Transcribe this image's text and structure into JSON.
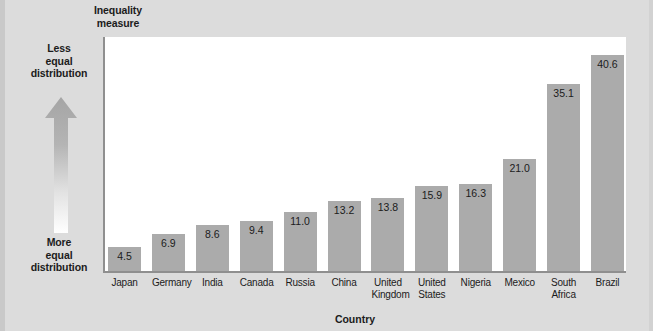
{
  "chart_data": {
    "type": "bar",
    "title": "",
    "ylabel": "Inequality measure",
    "xlabel": "Country",
    "ylim": [
      0,
      44
    ],
    "grid": false,
    "legend": "none",
    "categories": [
      "Japan",
      "Germany",
      "India",
      "Canada",
      "Russia",
      "China",
      "United Kingdom",
      "United States",
      "Nigeria",
      "Mexico",
      "South Africa",
      "Brazil"
    ],
    "values": [
      4.5,
      6.9,
      8.6,
      9.4,
      11.0,
      13.2,
      13.8,
      15.9,
      16.3,
      21.0,
      35.1,
      40.6
    ],
    "value_labels": [
      "4.5",
      "6.9",
      "8.6",
      "9.4",
      "11.0",
      "13.2",
      "13.8",
      "15.9",
      "16.3",
      "21.0",
      "35.1",
      "40.6"
    ],
    "annotations": [
      {
        "name": "axis-direction-top",
        "text": "Less equal distribution"
      },
      {
        "name": "axis-direction-bottom",
        "text": "More equal distribution"
      }
    ]
  },
  "axis": {
    "y_title_line1": "Inequality",
    "y_title_line2": "measure",
    "x_title": "Country"
  },
  "annotations": {
    "less_equal_line1": "Less",
    "less_equal_line2": "equal",
    "less_equal_line3": "distribution",
    "more_equal_line1": "More",
    "more_equal_line2": "equal",
    "more_equal_line3": "distribution"
  },
  "categories": [
    {
      "line1": "Japan",
      "line2": ""
    },
    {
      "line1": "Germany",
      "line2": ""
    },
    {
      "line1": "India",
      "line2": ""
    },
    {
      "line1": "Canada",
      "line2": ""
    },
    {
      "line1": "Russia",
      "line2": ""
    },
    {
      "line1": "China",
      "line2": ""
    },
    {
      "line1": "United",
      "line2": "Kingdom"
    },
    {
      "line1": "United",
      "line2": "States"
    },
    {
      "line1": "Nigeria",
      "line2": ""
    },
    {
      "line1": "Mexico",
      "line2": ""
    },
    {
      "line1": "South",
      "line2": "Africa"
    },
    {
      "line1": "Brazil",
      "line2": ""
    }
  ],
  "colors": {
    "background": "#dcdcdc",
    "plot_background": "#ffffff",
    "bar_fill": "#ababab",
    "axis_line": "#8f8f8f",
    "text": "#1b1b1b",
    "arrow_top": "#a8a8a8",
    "arrow_bottom": "#ffffff"
  }
}
